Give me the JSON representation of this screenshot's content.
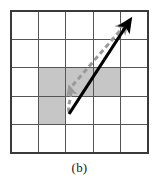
{
  "figure": {
    "caption": "(b)",
    "type": "grid-vector-diagram",
    "grid": {
      "columns": 5,
      "rows": 5,
      "left": 11,
      "top": 11,
      "right": 148,
      "bottom": 153,
      "cell_width": 27.4,
      "cell_height": 28.4,
      "line_color": "#555555",
      "line_width": 1.2,
      "border_color": "#3a3a3a",
      "border_width": 1.6,
      "background": "#ffffff"
    },
    "shaded_cells": [
      {
        "col": 1,
        "row": 2
      },
      {
        "col": 2,
        "row": 2
      },
      {
        "col": 3,
        "row": 2
      },
      {
        "col": 1,
        "row": 3
      }
    ],
    "shaded_color": "#c6c6c6",
    "vectors": [
      {
        "name": "solid-black-arrow",
        "style": "solid",
        "color": "#000000",
        "width": 3.2,
        "start_x": 69,
        "start_y": 114,
        "end_x": 129,
        "end_y": 22,
        "arrowhead": "large"
      },
      {
        "name": "dashed-gray-path-segment-up",
        "style": "dashed",
        "color": "#9a9a9a",
        "width": 3.0,
        "start_x": 69,
        "start_y": 112,
        "end_x": 70,
        "end_y": 88,
        "arrowhead": "small"
      },
      {
        "name": "dashed-gray-path-diagonal",
        "style": "dashed",
        "color": "#9a9a9a",
        "width": 3.0,
        "start_x": 72,
        "start_y": 86,
        "end_x": 125,
        "end_y": 25,
        "arrowhead": "large"
      }
    ]
  }
}
